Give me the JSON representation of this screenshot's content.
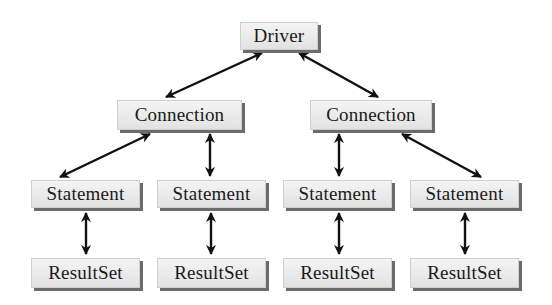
{
  "diagram": {
    "title": "",
    "nodes": [
      {
        "id": "driver",
        "label": "Driver",
        "x": 240,
        "y": 22,
        "w": 78,
        "h": 28
      },
      {
        "id": "connection_1",
        "label": "Connection",
        "x": 117,
        "y": 100,
        "w": 125,
        "h": 30
      },
      {
        "id": "connection_2",
        "label": "Connection",
        "x": 310,
        "y": 100,
        "w": 122,
        "h": 30
      },
      {
        "id": "statement_1",
        "label": "Statement",
        "x": 31,
        "y": 180,
        "w": 109,
        "h": 28
      },
      {
        "id": "statement_2",
        "label": "Statement",
        "x": 157,
        "y": 180,
        "w": 109,
        "h": 28
      },
      {
        "id": "statement_3",
        "label": "Statement",
        "x": 283,
        "y": 180,
        "w": 109,
        "h": 28
      },
      {
        "id": "statement_4",
        "label": "Statement",
        "x": 410,
        "y": 180,
        "w": 109,
        "h": 28
      },
      {
        "id": "resultset_1",
        "label": "ResultSet",
        "x": 31,
        "y": 258,
        "w": 109,
        "h": 30
      },
      {
        "id": "resultset_2",
        "label": "ResultSet",
        "x": 157,
        "y": 258,
        "w": 109,
        "h": 30
      },
      {
        "id": "resultset_3",
        "label": "ResultSet",
        "x": 283,
        "y": 258,
        "w": 109,
        "h": 30
      },
      {
        "id": "resultset_4",
        "label": "ResultSet",
        "x": 410,
        "y": 258,
        "w": 109,
        "h": 30
      }
    ],
    "edges": [
      {
        "from": "driver",
        "to": "connection_1",
        "bidirectional": true
      },
      {
        "from": "driver",
        "to": "connection_2",
        "bidirectional": true
      },
      {
        "from": "connection_1",
        "to": "statement_1",
        "bidirectional": true
      },
      {
        "from": "connection_1",
        "to": "statement_2",
        "bidirectional": true
      },
      {
        "from": "connection_2",
        "to": "statement_3",
        "bidirectional": true
      },
      {
        "from": "connection_2",
        "to": "statement_4",
        "bidirectional": true
      },
      {
        "from": "statement_1",
        "to": "resultset_1",
        "bidirectional": true
      },
      {
        "from": "statement_2",
        "to": "resultset_2",
        "bidirectional": true
      },
      {
        "from": "statement_3",
        "to": "resultset_3",
        "bidirectional": true
      },
      {
        "from": "statement_4",
        "to": "resultset_4",
        "bidirectional": true
      }
    ],
    "colors": {
      "box_fill": "#e8e8e8",
      "box_shadow": "#6b6b6b",
      "arrow": "#111111",
      "text": "#1a1a1a"
    }
  }
}
